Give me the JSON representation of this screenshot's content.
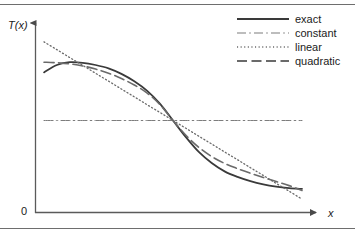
{
  "figure": {
    "ylabel": "T(x)",
    "xlabel": "x",
    "origin_label": "0"
  },
  "legend": {
    "entries": [
      {
        "label": "exact",
        "style": "solid",
        "color": "#3a3a3a"
      },
      {
        "label": "constant",
        "style": "dashdot",
        "color": "#7d7d7d"
      },
      {
        "label": "linear",
        "style": "dotted",
        "color": "#6a6a6a"
      },
      {
        "label": "quadratic",
        "style": "longdash",
        "color": "#6a6a6a"
      }
    ]
  },
  "chart_data": {
    "type": "line",
    "title": "",
    "xlabel": "x",
    "ylabel": "T(x)",
    "xlim": [
      0,
      1
    ],
    "ylim": [
      0,
      1
    ],
    "grid": false,
    "legend_position": "top-right",
    "x": [
      0.0,
      0.05,
      0.1,
      0.15,
      0.2,
      0.25,
      0.3,
      0.35,
      0.4,
      0.45,
      0.5,
      0.55,
      0.6,
      0.65,
      0.7,
      0.75,
      0.8,
      0.85,
      0.9,
      0.95,
      1.0
    ],
    "series": [
      {
        "name": "exact",
        "style": "solid",
        "values": [
          0.76,
          0.8,
          0.815,
          0.812,
          0.8,
          0.782,
          0.752,
          0.712,
          0.66,
          0.59,
          0.5,
          0.41,
          0.33,
          0.27,
          0.225,
          0.195,
          0.172,
          0.155,
          0.143,
          0.135,
          0.13
        ]
      },
      {
        "name": "constant",
        "style": "dashdot",
        "values": [
          0.5,
          0.5,
          0.5,
          0.5,
          0.5,
          0.5,
          0.5,
          0.5,
          0.5,
          0.5,
          0.5,
          0.5,
          0.5,
          0.5,
          0.5,
          0.5,
          0.5,
          0.5,
          0.5,
          0.5,
          0.5
        ]
      },
      {
        "name": "linear",
        "style": "dotted",
        "values": [
          0.925,
          0.883,
          0.84,
          0.798,
          0.755,
          0.713,
          0.67,
          0.628,
          0.585,
          0.543,
          0.5,
          0.458,
          0.415,
          0.373,
          0.33,
          0.288,
          0.245,
          0.203,
          0.16,
          0.118,
          0.075
        ]
      },
      {
        "name": "quadratic",
        "style": "longdash",
        "values": [
          0.815,
          0.812,
          0.806,
          0.795,
          0.778,
          0.756,
          0.727,
          0.692,
          0.648,
          0.585,
          0.5,
          0.42,
          0.355,
          0.305,
          0.268,
          0.24,
          0.215,
          0.192,
          0.17,
          0.148,
          0.122
        ]
      }
    ]
  }
}
